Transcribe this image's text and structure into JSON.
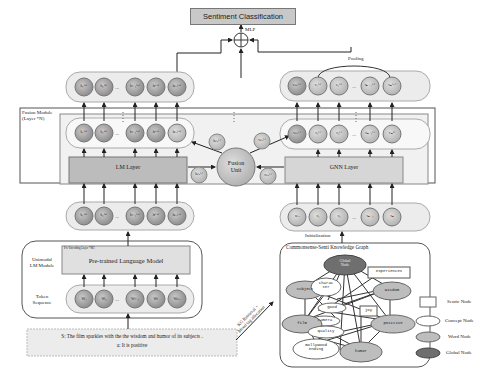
{
  "title": "Sentiment Classification",
  "mlp_label": "MLP",
  "pooling_label": "Pooling",
  "fusion_module": {
    "label_line1": "Fusion Module",
    "label_line2": "(Layer *N)"
  },
  "lm_layer": "LM Layer",
  "gnn_layer": "GNN Layer",
  "fusion_unit": {
    "line1": "Fusion",
    "line2": "Unit"
  },
  "initialization_label": "Initialization",
  "kg_title": "Commonsense-Senti Knowledge Graph",
  "kg_arrow_label": {
    "line1": "KG Retrieval +",
    "line2": "Mood tag allocation"
  },
  "unimodal": {
    "label_line1": "Unimodal",
    "label_line2": "LM Module",
    "plm": "Pre-trained Language Model",
    "plm_note": "Pre-Encoding Layer *M1"
  },
  "token_sequence": {
    "label_line1": "Token",
    "label_line2": "Sequence",
    "tokens": [
      "W₁",
      "W₂",
      "...",
      "Wₜ₋₁",
      "Wₜ",
      "Wₚₐ"
    ]
  },
  "input": {
    "sentence": "S:  The film sparkles with the the wisdom and humor of its subjects .",
    "label": "a:   It is positive"
  },
  "lm_top_nodes": [
    "h₁⁽ᴹ⁾",
    "h₂⁽ᴹ⁾",
    "...",
    "hₜ₋₁⁽ᴹ⁾",
    "hₜ⁽ᴹ⁾",
    "hₚₐ⁽ᴹ⁾"
  ],
  "lm_mid_nodes": [
    "h₁⁽ᴹ⁾",
    "h₂⁽ᴹ⁾",
    "...",
    "hₜ₋₁⁽ᴹ⁾",
    "hₜ⁽ᴹ⁾",
    "hₚₐ⁽ᴹ⁾"
  ],
  "lm_in_nodes": [
    "h₁⁽ᴹ⁾",
    "h₂⁽ᴹ⁾",
    "...",
    "hₜ₋₁⁽ᴹ⁾",
    "hₜ⁽ᴹ⁾",
    "hₚₐ⁽ᴹ⁾"
  ],
  "gnn_top_nodes": [
    "vₚₐ⁽ᴺ⁾",
    "v₁⁽ᴺ⁾",
    "v₂⁽ᴺ⁾",
    "...",
    "vₙ₋₁⁽ᴺ⁾",
    "vₙ⁽ᴺ⁾"
  ],
  "gnn_mid_nodes": [
    "vₚₐ⁽ˡ⁾",
    "v₁⁽ˡ⁾",
    "v₂⁽ˡ⁾",
    "...",
    "vₙ₋₁⁽ˡ⁾",
    "vₙ⁽ˡ⁾"
  ],
  "gnn_in_nodes": [
    "vₚₐ",
    "v₁",
    "v₂",
    "...",
    "vₙ₋₁",
    "vₙ"
  ],
  "fusion_small_nodes": [
    "hₚₐ⁽ˡ⁾",
    "hₚₐ⁽ˡ⁾",
    "vₚₐ⁽ˡ⁾",
    "vₚₐ⁽ˡ⁾"
  ],
  "kg_nodes": {
    "global": {
      "line1": "Global",
      "line2": "Node"
    },
    "experiences": "experiences",
    "subject": "subject",
    "wisdom": "wisdom",
    "character": {
      "line1": "charac",
      "line2": "ter"
    },
    "good": "good",
    "joy": "joy",
    "camera": "camera",
    "film": "film",
    "positive": "positive",
    "quality": "quality",
    "bollywood": {
      "line1": "Bollywood",
      "line2": "ending"
    },
    "humor": "humor"
  },
  "legend": [
    {
      "label": "Sentic Node",
      "shape": "rect",
      "color": "#ffffff"
    },
    {
      "label": "Concept Node",
      "shape": "ellipse",
      "color": "#ffffff"
    },
    {
      "label": "Word Node",
      "shape": "ellipse",
      "color": "#bdbdbd"
    },
    {
      "label": "Global Node",
      "shape": "ellipse",
      "color": "#6f6f6f"
    }
  ]
}
